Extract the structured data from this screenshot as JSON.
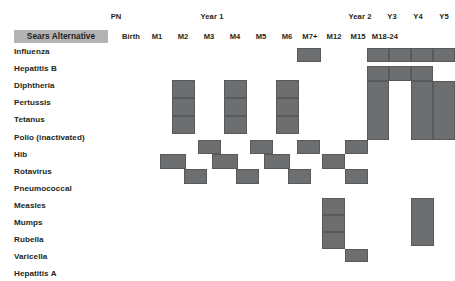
{
  "title_cell": {
    "label": "Sears Alternative"
  },
  "periods": [
    {
      "label": "PN",
      "x": 116,
      "y": 12
    },
    {
      "label": "Year 1",
      "x": 212,
      "y": 12
    },
    {
      "label": "Year 2",
      "x": 360,
      "y": 12
    },
    {
      "label": "Y3",
      "x": 392,
      "y": 12
    },
    {
      "label": "Y4",
      "x": 418,
      "y": 12
    },
    {
      "label": "Y5",
      "x": 444,
      "y": 12
    }
  ],
  "columns": [
    {
      "key": "birth",
      "label": "Birth",
      "cx": 131
    },
    {
      "key": "m1",
      "label": "M1",
      "cx": 157
    },
    {
      "key": "m2",
      "label": "M2",
      "cx": 183
    },
    {
      "key": "m3",
      "label": "M3",
      "cx": 209
    },
    {
      "key": "m4",
      "label": "M4",
      "cx": 235
    },
    {
      "key": "m5",
      "label": "M5",
      "cx": 261
    },
    {
      "key": "m6",
      "label": "M6",
      "cx": 287
    },
    {
      "key": "m7plus",
      "label": "M7+",
      "cx": 310
    },
    {
      "key": "m12",
      "label": "M12",
      "cx": 334
    },
    {
      "key": "m15",
      "label": "M15",
      "cx": 358
    },
    {
      "key": "m1824",
      "label": "M18-24",
      "cx": 385
    },
    {
      "key": "y3",
      "label": "",
      "cx": 406
    },
    {
      "key": "y4",
      "label": "",
      "cx": 428
    },
    {
      "key": "y5",
      "label": "",
      "cx": 448
    }
  ],
  "rows": [
    {
      "key": "influenza",
      "label": "Influenza"
    },
    {
      "key": "hepb",
      "label": "Hepatitis B"
    },
    {
      "key": "diphtheria",
      "label": "Diphtheria"
    },
    {
      "key": "pertussis",
      "label": "Pertussis"
    },
    {
      "key": "tetanus",
      "label": "Tetanus"
    },
    {
      "key": "polio",
      "label": "Polio (inactivated)"
    },
    {
      "key": "hib",
      "label": "Hib"
    },
    {
      "key": "rotavirus",
      "label": "Rotavirus"
    },
    {
      "key": "pneumo",
      "label": "Pneumococcal"
    },
    {
      "key": "measles",
      "label": "Measles"
    },
    {
      "key": "mumps",
      "label": "Mumps"
    },
    {
      "key": "rubella",
      "label": "Rubella"
    },
    {
      "key": "varicella",
      "label": "Varicella"
    },
    {
      "key": "hepa",
      "label": "Hepatitis A"
    }
  ],
  "colors": {
    "cell_fill": "#6d6e70",
    "cell_border": "#58595b",
    "title_band": "#b3b3b3",
    "text": "#231f20",
    "background": "#ffffff"
  },
  "chart_data": {
    "type": "heatmap",
    "xlabel": "Age",
    "ylabel": "Vaccine",
    "categories": [
      "Birth",
      "M1",
      "M2",
      "M3",
      "M4",
      "M5",
      "M6",
      "M7+",
      "M12",
      "M15",
      "M18-24",
      "Y3",
      "Y4",
      "Y5"
    ],
    "row_categories": [
      "Influenza",
      "Hepatitis B",
      "Diphtheria",
      "Pertussis",
      "Tetanus",
      "Polio (inactivated)",
      "Hib",
      "Rotavirus",
      "Pneumococcal",
      "Measles",
      "Mumps",
      "Rubella",
      "Varicella",
      "Hepatitis A"
    ],
    "legend": [],
    "grid": false,
    "marks": [
      {
        "row": "influenza",
        "col": "m7plus",
        "x": 297,
        "y": 48,
        "w": 24,
        "h": 13.5
      },
      {
        "row": "influenza",
        "col": "m1824",
        "x": 367,
        "y": 48,
        "w": 22,
        "h": 13.5
      },
      {
        "row": "influenza",
        "col": "y3",
        "x": 389,
        "y": 48,
        "w": 22,
        "h": 13.5
      },
      {
        "row": "influenza",
        "col": "y4",
        "x": 411,
        "y": 48,
        "w": 22,
        "h": 13.5
      },
      {
        "row": "influenza",
        "col": "y5",
        "x": 433,
        "y": 48,
        "w": 22,
        "h": 13.5
      },
      {
        "row": "hepb",
        "col": "m1824",
        "x": 367,
        "y": 66,
        "w": 22,
        "h": 15
      },
      {
        "row": "hepb",
        "col": "y3",
        "x": 389,
        "y": 66,
        "w": 22,
        "h": 15
      },
      {
        "row": "hepb",
        "col": "y4",
        "x": 411,
        "y": 66,
        "w": 22,
        "h": 15
      },
      {
        "row": "diphtheria",
        "col": "m2",
        "x": 172,
        "y": 80,
        "w": 23,
        "h": 18
      },
      {
        "row": "diphtheria",
        "col": "m4",
        "x": 224,
        "y": 80,
        "w": 23,
        "h": 18
      },
      {
        "row": "diphtheria",
        "col": "m6",
        "x": 276,
        "y": 80,
        "w": 23,
        "h": 18
      },
      {
        "row": "diphtheria",
        "col": "m1824",
        "x": 367,
        "y": 81,
        "w": 22,
        "h": 59
      },
      {
        "row": "diphtheria",
        "col": "y4",
        "x": 411,
        "y": 81,
        "w": 22,
        "h": 59
      },
      {
        "row": "diphtheria",
        "col": "y5",
        "x": 433,
        "y": 81,
        "w": 22,
        "h": 59
      },
      {
        "row": "pertussis",
        "col": "m2",
        "x": 172,
        "y": 98,
        "w": 23,
        "h": 18
      },
      {
        "row": "pertussis",
        "col": "m4",
        "x": 224,
        "y": 98,
        "w": 23,
        "h": 18
      },
      {
        "row": "pertussis",
        "col": "m6",
        "x": 276,
        "y": 98,
        "w": 23,
        "h": 18
      },
      {
        "row": "tetanus",
        "col": "m2",
        "x": 172,
        "y": 116,
        "w": 23,
        "h": 18
      },
      {
        "row": "tetanus",
        "col": "m4",
        "x": 224,
        "y": 116,
        "w": 23,
        "h": 18
      },
      {
        "row": "tetanus",
        "col": "m6",
        "x": 276,
        "y": 116,
        "w": 23,
        "h": 18
      },
      {
        "row": "hib",
        "col": "m3",
        "x": 198,
        "y": 140,
        "w": 23,
        "h": 14
      },
      {
        "row": "hib",
        "col": "m5",
        "x": 250,
        "y": 140,
        "w": 23,
        "h": 14
      },
      {
        "row": "hib",
        "col": "m7plus",
        "x": 297,
        "y": 140,
        "w": 23,
        "h": 14
      },
      {
        "row": "hib",
        "col": "m15",
        "x": 345,
        "y": 140,
        "w": 23,
        "h": 14
      },
      {
        "row": "rotavirus",
        "col": "m2",
        "x": 160,
        "y": 154,
        "w": 26,
        "h": 15
      },
      {
        "row": "rotavirus",
        "col": "m4",
        "x": 212,
        "y": 154,
        "w": 26,
        "h": 15
      },
      {
        "row": "rotavirus",
        "col": "m6",
        "x": 264,
        "y": 154,
        "w": 26,
        "h": 15
      },
      {
        "row": "rotavirus",
        "col": "m12",
        "x": 322,
        "y": 154,
        "w": 23,
        "h": 15
      },
      {
        "row": "pneumo",
        "col": "m3",
        "x": 184,
        "y": 169,
        "w": 23,
        "h": 15
      },
      {
        "row": "pneumo",
        "col": "m5",
        "x": 236,
        "y": 169,
        "w": 23,
        "h": 15
      },
      {
        "row": "pneumo",
        "col": "m7plus",
        "x": 288,
        "y": 169,
        "w": 23,
        "h": 15
      },
      {
        "row": "pneumo",
        "col": "m15",
        "x": 345,
        "y": 169,
        "w": 23,
        "h": 15
      },
      {
        "row": "measles",
        "col": "m12",
        "x": 322,
        "y": 198,
        "w": 23,
        "h": 17
      },
      {
        "row": "mumps",
        "col": "m12",
        "x": 322,
        "y": 215,
        "w": 23,
        "h": 17
      },
      {
        "row": "rubella",
        "col": "m12",
        "x": 322,
        "y": 232,
        "w": 23,
        "h": 17
      },
      {
        "row": "varicella",
        "col": "m15",
        "x": 345,
        "y": 249,
        "w": 23,
        "h": 13
      },
      {
        "row": "hepa",
        "col": "y3",
        "x": 411,
        "y": 198,
        "w": 23,
        "h": 48
      }
    ]
  }
}
